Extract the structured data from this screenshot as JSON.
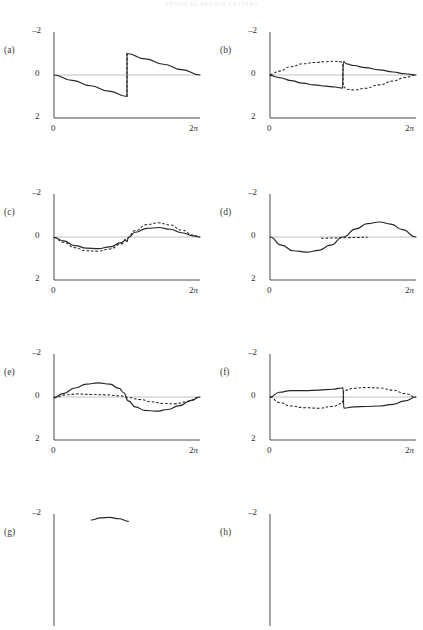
{
  "header": {
    "running_head": "PHYSICAL REVIEW LETTERS"
  },
  "figure": {
    "x_axis": {
      "min_label": "0",
      "max_label": "2π",
      "min": 0,
      "max": 6.283185
    },
    "y_axis": {
      "top_label": "–2",
      "mid_label": "0",
      "bottom_label": "2",
      "top": -2,
      "mid": 0,
      "bottom": 2,
      "inverted": true
    },
    "colors": {
      "curve": "#262626",
      "axis": "#4a4a4a",
      "zero": "#b9b9b9",
      "label": "#3a3a3a"
    },
    "panels": [
      {
        "id": "a",
        "label": "(a)",
        "col": 0,
        "row": 0,
        "cut_off": false
      },
      {
        "id": "b",
        "label": "(b)",
        "col": 1,
        "row": 0,
        "cut_off": false
      },
      {
        "id": "c",
        "label": "(c)",
        "col": 0,
        "row": 1,
        "cut_off": false
      },
      {
        "id": "d",
        "label": "(d)",
        "col": 1,
        "row": 1,
        "cut_off": false
      },
      {
        "id": "e",
        "label": "(e)",
        "col": 0,
        "row": 2,
        "cut_off": false
      },
      {
        "id": "f",
        "label": "(f)",
        "col": 1,
        "row": 2,
        "cut_off": false
      },
      {
        "id": "g",
        "label": "(g)",
        "col": 0,
        "row": 3,
        "cut_off": true
      },
      {
        "id": "h",
        "label": "(h)",
        "col": 1,
        "row": 3,
        "cut_off": true
      }
    ]
  },
  "chart_data": [
    {
      "type": "line",
      "panel": "a",
      "title": "(a)",
      "xlabel": "",
      "ylabel": "",
      "xlim": [
        0,
        6.283185
      ],
      "ylim": [
        2,
        -2
      ],
      "xticks": [
        0,
        6.283185
      ],
      "xticklabels": [
        "0",
        "2π"
      ],
      "yticks": [
        -2,
        0,
        2
      ],
      "yticklabels": [
        "–2",
        "0",
        "2"
      ],
      "grid": false,
      "legend": null,
      "y_axis_inverted": true,
      "series": [
        {
          "name": "sawtooth-solid",
          "style": "solid",
          "x": [
            0.0,
            0.7854,
            1.5708,
            2.3562,
            3.1416,
            3.1416,
            3.927,
            4.7124,
            5.4978,
            6.2832
          ],
          "y": [
            0.0,
            0.25,
            0.5,
            0.75,
            1.0,
            -1.0,
            -0.75,
            -0.5,
            -0.25,
            0.0
          ]
        },
        {
          "name": "jump-dashed",
          "style": "dashed",
          "x": [
            3.1416,
            3.1416
          ],
          "y": [
            1.0,
            -1.0
          ]
        }
      ]
    },
    {
      "type": "line",
      "panel": "b",
      "title": "(b)",
      "xlabel": "",
      "ylabel": "",
      "xlim": [
        0,
        6.283185
      ],
      "ylim": [
        2,
        -2
      ],
      "xticks": [
        0,
        6.283185
      ],
      "xticklabels": [
        "0",
        "2π"
      ],
      "yticks": [
        -2,
        0,
        2
      ],
      "yticklabels": [
        "–2",
        "0",
        "2"
      ],
      "grid": false,
      "legend": null,
      "y_axis_inverted": true,
      "series": [
        {
          "name": "solid",
          "style": "solid",
          "x": [
            0.0,
            0.4,
            0.9,
            1.4,
            1.9,
            2.4,
            2.8,
            3.05,
            3.12,
            3.16,
            3.3,
            3.6,
            4.1,
            4.7,
            5.3,
            5.8,
            6.2832
          ],
          "y": [
            0.02,
            0.12,
            0.26,
            0.38,
            0.46,
            0.52,
            0.56,
            0.6,
            0.62,
            -0.62,
            -0.52,
            -0.44,
            -0.34,
            -0.24,
            -0.14,
            -0.06,
            0.0
          ]
        },
        {
          "name": "dashed",
          "style": "dashed",
          "x": [
            0.0,
            0.4,
            0.9,
            1.4,
            1.9,
            2.4,
            2.8,
            3.05,
            3.12,
            3.16,
            3.3,
            3.6,
            4.1,
            4.7,
            5.3,
            5.8,
            6.2832
          ],
          "y": [
            -0.02,
            -0.18,
            -0.38,
            -0.52,
            -0.58,
            -0.62,
            -0.64,
            -0.62,
            -0.55,
            0.55,
            0.66,
            0.7,
            0.62,
            0.46,
            0.28,
            0.12,
            0.0
          ]
        }
      ]
    },
    {
      "type": "line",
      "panel": "c",
      "title": "(c)",
      "xlabel": "",
      "ylabel": "",
      "xlim": [
        0,
        6.283185
      ],
      "ylim": [
        2,
        -2
      ],
      "xticks": [
        0,
        6.283185
      ],
      "xticklabels": [
        "0",
        "2π"
      ],
      "yticks": [
        -2,
        0,
        2
      ],
      "yticklabels": [
        "–2",
        "0",
        "2"
      ],
      "grid": false,
      "legend": null,
      "y_axis_inverted": true,
      "series": [
        {
          "name": "solid",
          "style": "solid",
          "x": [
            0.0,
            0.4,
            0.9,
            1.4,
            1.9,
            2.4,
            2.9,
            3.08,
            3.14,
            3.2,
            3.5,
            4.0,
            4.5,
            5.0,
            5.5,
            6.0,
            6.2832
          ],
          "y": [
            0.02,
            0.18,
            0.4,
            0.52,
            0.54,
            0.46,
            0.26,
            0.14,
            0.22,
            0.02,
            -0.22,
            -0.4,
            -0.44,
            -0.36,
            -0.2,
            -0.05,
            0.0
          ]
        },
        {
          "name": "dashed",
          "style": "dashed",
          "x": [
            0.0,
            0.4,
            0.9,
            1.4,
            1.9,
            2.4,
            2.9,
            3.14,
            3.5,
            4.0,
            4.5,
            5.0,
            5.5,
            6.0,
            6.2832
          ],
          "y": [
            0.02,
            0.24,
            0.5,
            0.64,
            0.66,
            0.56,
            0.32,
            0.06,
            -0.3,
            -0.58,
            -0.66,
            -0.56,
            -0.32,
            -0.08,
            0.0
          ]
        }
      ]
    },
    {
      "type": "line",
      "panel": "d",
      "title": "(d)",
      "xlabel": "",
      "ylabel": "",
      "xlim": [
        0,
        6.283185
      ],
      "ylim": [
        2,
        -2
      ],
      "xticks": [
        0,
        6.283185
      ],
      "xticklabels": [
        "0",
        "2π"
      ],
      "yticks": [
        -2,
        0,
        2
      ],
      "yticklabels": [
        "–2",
        "0",
        "2"
      ],
      "grid": false,
      "legend": null,
      "y_axis_inverted": true,
      "series": [
        {
          "name": "sine-solid",
          "style": "solid",
          "x": [
            0.0,
            0.5,
            1.0,
            1.5708,
            2.1,
            2.6,
            3.1416,
            3.7,
            4.2,
            4.7124,
            5.2,
            5.7,
            6.2832
          ],
          "y": [
            0.0,
            0.38,
            0.64,
            0.7,
            0.62,
            0.38,
            0.0,
            -0.38,
            -0.62,
            -0.7,
            -0.6,
            -0.34,
            0.0
          ]
        },
        {
          "name": "flat-dashed",
          "style": "dashed",
          "x": [
            2.2,
            2.6,
            3.0,
            3.4,
            3.8,
            4.2
          ],
          "y": [
            0.06,
            0.05,
            0.04,
            0.03,
            0.02,
            0.01
          ]
        }
      ]
    },
    {
      "type": "line",
      "panel": "e",
      "title": "(e)",
      "xlabel": "",
      "ylabel": "",
      "xlim": [
        0,
        6.283185
      ],
      "ylim": [
        2,
        -2
      ],
      "xticks": [
        0,
        6.283185
      ],
      "xticklabels": [
        "0",
        "2π"
      ],
      "yticks": [
        -2,
        0,
        2
      ],
      "yticklabels": [
        "–2",
        "0",
        "2"
      ],
      "grid": false,
      "legend": null,
      "y_axis_inverted": true,
      "series": [
        {
          "name": "solid",
          "style": "solid",
          "x": [
            0.0,
            0.4,
            0.9,
            1.4,
            1.9,
            2.4,
            2.8,
            3.0,
            3.2,
            3.5,
            3.9,
            4.4,
            4.9,
            5.4,
            5.9,
            6.2832
          ],
          "y": [
            0.02,
            -0.16,
            -0.42,
            -0.6,
            -0.66,
            -0.6,
            -0.4,
            -0.2,
            0.18,
            0.46,
            0.62,
            0.66,
            0.58,
            0.4,
            0.16,
            0.0
          ]
        },
        {
          "name": "dashed",
          "style": "dashed",
          "x": [
            0.0,
            0.5,
            1.0,
            1.6,
            2.2,
            2.8,
            3.2,
            3.7,
            4.2,
            4.7,
            5.2,
            5.7,
            6.2832
          ],
          "y": [
            0.04,
            -0.1,
            -0.14,
            -0.12,
            -0.1,
            -0.06,
            0.02,
            0.12,
            0.22,
            0.3,
            0.32,
            0.22,
            0.0
          ]
        }
      ]
    },
    {
      "type": "line",
      "panel": "f",
      "title": "(f)",
      "xlabel": "",
      "ylabel": "",
      "xlim": [
        0,
        6.283185
      ],
      "ylim": [
        2,
        -2
      ],
      "xticks": [
        0,
        6.283185
      ],
      "xticklabels": [
        "0",
        "2π"
      ],
      "yticks": [
        -2,
        0,
        2
      ],
      "yticklabels": [
        "–2",
        "0",
        "2"
      ],
      "grid": false,
      "legend": null,
      "y_axis_inverted": true,
      "series": [
        {
          "name": "solid",
          "style": "solid",
          "x": [
            0.0,
            0.4,
            0.9,
            1.5,
            2.1,
            2.7,
            3.1,
            3.14,
            3.18,
            3.6,
            4.1,
            4.7,
            5.3,
            5.8,
            6.2832
          ],
          "y": [
            0.0,
            -0.22,
            -0.3,
            -0.3,
            -0.32,
            -0.36,
            -0.42,
            -0.44,
            0.52,
            0.46,
            0.44,
            0.42,
            0.34,
            0.18,
            0.0
          ]
        },
        {
          "name": "dashed",
          "style": "dashed",
          "x": [
            0.0,
            0.4,
            0.9,
            1.5,
            2.1,
            2.7,
            3.1,
            3.14,
            3.18,
            3.6,
            4.1,
            4.7,
            5.3,
            5.8,
            6.2832
          ],
          "y": [
            0.0,
            0.26,
            0.42,
            0.5,
            0.52,
            0.44,
            0.3,
            0.18,
            -0.3,
            -0.4,
            -0.44,
            -0.42,
            -0.32,
            -0.16,
            0.0
          ]
        }
      ]
    },
    {
      "type": "line",
      "panel": "g",
      "title": "(g)",
      "xlabel": "",
      "ylabel": "",
      "xlim": [
        0,
        6.283185
      ],
      "ylim": [
        2,
        -2
      ],
      "xticks": [],
      "xticklabels": [],
      "yticks": [
        -2
      ],
      "yticklabels": [
        "–2"
      ],
      "grid": false,
      "legend": null,
      "y_axis_inverted": true,
      "clipped": true,
      "series": [
        {
          "name": "solid-partial",
          "style": "solid",
          "x": [
            1.6,
            2.0,
            2.4,
            2.8,
            3.2
          ],
          "y": [
            -1.72,
            -1.82,
            -1.84,
            -1.78,
            -1.66
          ]
        }
      ]
    },
    {
      "type": "line",
      "panel": "h",
      "title": "(h)",
      "xlabel": "",
      "ylabel": "",
      "xlim": [
        0,
        6.283185
      ],
      "ylim": [
        2,
        -2
      ],
      "xticks": [],
      "xticklabels": [],
      "yticks": [
        -2
      ],
      "yticklabels": [
        "–2"
      ],
      "grid": false,
      "legend": null,
      "y_axis_inverted": true,
      "clipped": true,
      "series": []
    }
  ]
}
